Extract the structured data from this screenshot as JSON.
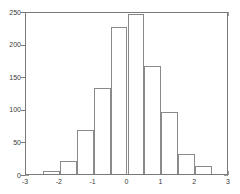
{
  "chart_data": {
    "type": "bar",
    "title": "",
    "subtitle": "",
    "xlabel": "",
    "ylabel": "",
    "xlim": [
      -3,
      3
    ],
    "ylim": [
      0,
      250
    ],
    "grid": false,
    "legend": null,
    "bin_width": 0.5,
    "bin_edges": [
      -3,
      -2.5,
      -2,
      -1.5,
      -1,
      -0.5,
      0,
      0.5,
      1,
      1.5,
      2,
      2.5,
      3
    ],
    "bin_centers": [
      -2.75,
      -2.25,
      -1.75,
      -1.25,
      -0.75,
      -0.25,
      0.25,
      0.75,
      1.25,
      1.75,
      2.25,
      2.75
    ],
    "categories": [
      "-2.75",
      "-2.25",
      "-1.75",
      "-1.25",
      "-0.75",
      "-0.25",
      "0.25",
      "0.75",
      "1.25",
      "1.75",
      "2.25",
      "2.75"
    ],
    "values": [
      0,
      5,
      20,
      67,
      132,
      225,
      245,
      165,
      95,
      31,
      13,
      0
    ],
    "bars": [
      {
        "x0": -3.0,
        "x1": -2.5,
        "value": 0
      },
      {
        "x0": -2.5,
        "x1": -2.0,
        "value": 5
      },
      {
        "x0": -2.0,
        "x1": -1.5,
        "value": 20
      },
      {
        "x0": -1.5,
        "x1": -1.0,
        "value": 67
      },
      {
        "x0": -1.0,
        "x1": -0.5,
        "value": 132
      },
      {
        "x0": -0.5,
        "x1": 0.0,
        "value": 225
      },
      {
        "x0": 0.0,
        "x1": 0.5,
        "value": 245
      },
      {
        "x0": 0.5,
        "x1": 1.0,
        "value": 165
      },
      {
        "x0": 1.0,
        "x1": 1.5,
        "value": 95
      },
      {
        "x0": 1.5,
        "x1": 2.0,
        "value": 31
      },
      {
        "x0": 2.0,
        "x1": 2.5,
        "value": 13
      },
      {
        "x0": 2.5,
        "x1": 3.0,
        "value": 0
      }
    ],
    "xticks": [
      -3,
      -2,
      -1,
      0,
      1,
      2,
      3
    ],
    "xtick_labels": [
      "-3",
      "-2",
      "-1",
      "0",
      "1",
      "2",
      "3"
    ],
    "yticks": [
      0,
      50,
      100,
      150,
      200,
      250
    ],
    "ytick_labels": [
      "0",
      "50",
      "100",
      "150",
      "200",
      "250"
    ],
    "colors": {
      "axis": "#7a7a7a",
      "tick": "#9a9a9a",
      "bar_edge": "#8a8a8a",
      "bar_fill": "#ffffff",
      "text": "#3a3a3a",
      "background": "#ffffff"
    }
  }
}
